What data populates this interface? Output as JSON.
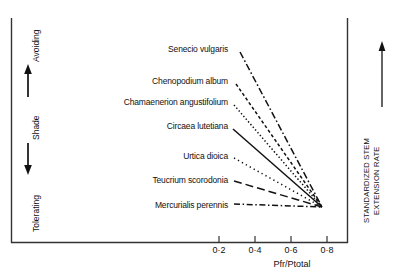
{
  "figure": {
    "background": "#ffffff",
    "ink": "#111111"
  },
  "left_axis": {
    "top_label": "Avoiding",
    "middle_label": "Shade",
    "bottom_label": "Tolerating",
    "up_arrow_icon": "arrow-up-icon",
    "down_arrow_icon": "arrow-down-icon"
  },
  "right_axis": {
    "label_line1": "STANDARDIZED STEM",
    "label_line2": "EXTENSION RATE",
    "arrow_icon": "arrow-up-icon"
  },
  "x_axis": {
    "title": "Pfr/Ptotal",
    "ticks": [
      "0·2",
      "0·4",
      "0·6",
      "0·8"
    ],
    "tick_values": [
      0.2,
      0.4,
      0.6,
      0.8
    ],
    "tick_x_px": [
      219,
      255,
      291,
      327
    ]
  },
  "chart_data": {
    "type": "line",
    "title": "",
    "subtitle": "",
    "xlabel": "Pfr/Ptotal",
    "ylabel": "STANDARDIZED STEM EXTENSION RATE",
    "ylabel_secondary": "Shade: Avoiding (up) / Tolerating (down)",
    "xlim": [
      0.1,
      0.85
    ],
    "ylim": [
      0,
      1
    ],
    "grid": false,
    "legend": "inline-labels-left",
    "annotations": [
      "All species' response lines converge to a common point at high Pfr/Ptotal (~0.78).",
      "Shade-avoiding species (top) show the steepest decline in stem extension rate with increasing Pfr/Ptotal.",
      "Shade-tolerating species (bottom) show little or no response."
    ],
    "convergence_point": {
      "x": 0.78,
      "y_px": 207,
      "x_px": 322
    },
    "series": [
      {
        "name": "Senecio vulgaris",
        "style": "dash-dot",
        "dasharray": "7,2.5,1.6,2.5",
        "label_x_px": 228,
        "label_y_px": 45,
        "start_px": [
          240,
          52
        ],
        "end_px": [
          322,
          207
        ],
        "slope_rank": 1,
        "shade_strategy": "avoiding"
      },
      {
        "name": "Chenopodium album",
        "style": "dashed-fine",
        "dasharray": "3.2,2.4",
        "label_x_px": 228,
        "label_y_px": 77,
        "start_px": [
          236,
          84
        ],
        "end_px": [
          322,
          207
        ],
        "slope_rank": 2,
        "shade_strategy": "avoiding"
      },
      {
        "name": "Chamaenerion angustifolium",
        "style": "dotted",
        "dasharray": "1.4,2.2",
        "label_x_px": 228,
        "label_y_px": 98,
        "start_px": [
          234,
          105
        ],
        "end_px": [
          322,
          207
        ],
        "slope_rank": 3,
        "shade_strategy": "avoiding"
      },
      {
        "name": "Circaea lutetiana",
        "style": "solid",
        "dasharray": "none",
        "label_x_px": 228,
        "label_y_px": 122,
        "start_px": [
          233,
          129
        ],
        "end_px": [
          322,
          207
        ],
        "slope_rank": 4,
        "shade_strategy": "intermediate"
      },
      {
        "name": "Urtica dioica",
        "style": "dotted-sparse",
        "dasharray": "1.3,3.2",
        "label_x_px": 228,
        "label_y_px": 152,
        "start_px": [
          234,
          158
        ],
        "end_px": [
          322,
          207
        ],
        "slope_rank": 5,
        "shade_strategy": "tolerating"
      },
      {
        "name": "Teucrium scorodonia",
        "style": "long-dash",
        "dasharray": "8,4",
        "label_x_px": 228,
        "label_y_px": 176,
        "start_px": [
          234,
          181
        ],
        "end_px": [
          322,
          207
        ],
        "slope_rank": 6,
        "shade_strategy": "tolerating"
      },
      {
        "name": "Mercurialis perennis",
        "style": "dash-dot-long",
        "dasharray": "6,2.6,1.5,2.6",
        "label_x_px": 228,
        "label_y_px": 201,
        "start_px": [
          234,
          204
        ],
        "end_px": [
          322,
          207
        ],
        "slope_rank": 7,
        "shade_strategy": "tolerating"
      }
    ]
  }
}
